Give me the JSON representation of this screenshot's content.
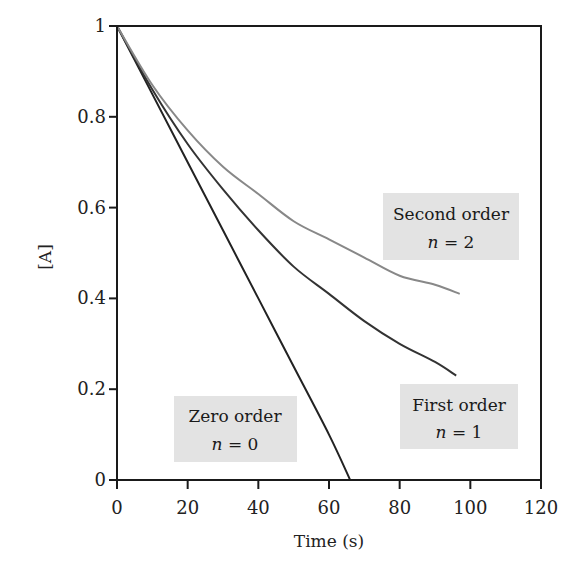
{
  "chart_data": {
    "type": "line",
    "title": "",
    "xlabel": "Time (s)",
    "ylabel": "[A]",
    "xlim": [
      0,
      120
    ],
    "ylim": [
      0,
      1
    ],
    "xticks": [
      0,
      20,
      40,
      60,
      80,
      100,
      120
    ],
    "yticks": [
      0,
      0.2,
      0.4,
      0.6,
      0.8,
      1
    ],
    "ytick_labels": [
      "0",
      "0.2",
      "0.4",
      "0.6",
      "0.8",
      "1"
    ],
    "xtick_labels": [
      "0",
      "20",
      "40",
      "60",
      "80",
      "100",
      "120"
    ],
    "grid": false,
    "legend": "none (inline annotation boxes)",
    "series": [
      {
        "name": "Zero order",
        "order_label": "n = 0",
        "color": "#222222",
        "x": [
          0,
          10,
          20,
          30,
          40,
          50,
          60,
          66
        ],
        "y": [
          1.0,
          0.85,
          0.7,
          0.55,
          0.4,
          0.25,
          0.1,
          0.0
        ]
      },
      {
        "name": "First order",
        "order_label": "n = 1",
        "color": "#333333",
        "x": [
          0,
          10,
          20,
          30,
          40,
          50,
          60,
          70,
          80,
          90,
          96
        ],
        "y": [
          1.0,
          0.86,
          0.74,
          0.64,
          0.55,
          0.47,
          0.41,
          0.35,
          0.3,
          0.26,
          0.23
        ]
      },
      {
        "name": "Second order",
        "order_label": "n = 2",
        "color": "#888888",
        "x": [
          0,
          10,
          20,
          30,
          40,
          50,
          60,
          70,
          80,
          90,
          97
        ],
        "y": [
          1.0,
          0.87,
          0.77,
          0.69,
          0.63,
          0.57,
          0.53,
          0.49,
          0.45,
          0.43,
          0.41
        ]
      }
    ],
    "annotations": [
      {
        "id": "second",
        "line1": "Second order",
        "line2_var": "n",
        "line2_rest": " = 2"
      },
      {
        "id": "first",
        "line1": "First order",
        "line2_var": "n",
        "line2_rest": " = 1"
      },
      {
        "id": "zero",
        "line1": "Zero order",
        "line2_var": "n",
        "line2_rest": " = 0"
      }
    ]
  },
  "colors": {
    "axis": "#1a1a1a",
    "annotation_box": "#e3e3e3"
  }
}
